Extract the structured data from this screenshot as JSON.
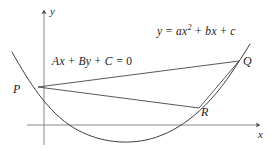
{
  "figure": {
    "kind": "math-diagram",
    "background_color": "#ffffff",
    "stroke_color": "#3a3a3a",
    "axis_color": "#6f6f6f",
    "text_color": "#1b1b1b"
  },
  "axes": {
    "y_axis_label": "y",
    "x_axis_label": "x",
    "origin": {
      "x": 44,
      "y": 125
    },
    "x_axis": {
      "x1": 27,
      "y1": 125,
      "x2": 262,
      "y2": 125
    },
    "y_axis": {
      "x1": 44,
      "y1": 145,
      "x2": 44,
      "y2": 10
    }
  },
  "points": [
    {
      "name": "P",
      "label": "P",
      "x": 38,
      "y": 87
    },
    {
      "name": "Q",
      "label": "Q",
      "x": 238,
      "y": 62
    },
    {
      "name": "R",
      "label": "R",
      "x": 198,
      "y": 108
    }
  ],
  "equations": {
    "line": {
      "label_text": "Ax + By + C = 0",
      "parts": [
        "A",
        "x",
        " + ",
        "B",
        "y",
        " + ",
        "C",
        " = ",
        "0"
      ]
    },
    "parabola": {
      "label_text": "y = ax2 + bx + c",
      "lhs": "y",
      "eq": " = ",
      "coef_a": "a",
      "var_x": "x",
      "exponent": "2",
      "plus1": " + ",
      "coef_b": "b",
      "var_x2": "x",
      "plus2": " + ",
      "coef_c": "c"
    }
  },
  "curves": {
    "parabola_path": "M 12,52 C 30,84 48,112 74,128 C 96,141 122,145 146,140 C 174,134 204,114 232,72 C 238,63 244,54 250,44",
    "chord_PQ": {
      "x1": 38,
      "y1": 87,
      "x2": 238,
      "y2": 62
    },
    "chord_PR": {
      "x1": 38,
      "y1": 87,
      "x2": 198,
      "y2": 108
    },
    "segment_RQ": {
      "x1": 198,
      "y1": 108,
      "x2": 238,
      "y2": 62
    }
  }
}
